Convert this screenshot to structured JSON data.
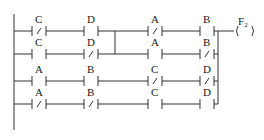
{
  "diagram": {
    "type": "ladder-logic",
    "output": {
      "label": "F",
      "subscript": "2"
    },
    "rungs": [
      {
        "contacts": [
          {
            "label": "C",
            "negated": true
          },
          {
            "label": "D",
            "negated": false
          },
          {
            "label": "A",
            "negated": true
          },
          {
            "label": "B",
            "negated": false
          }
        ]
      },
      {
        "contacts": [
          {
            "label": "C",
            "negated": false
          },
          {
            "label": "D",
            "negated": true
          },
          {
            "label": "A",
            "negated": false
          },
          {
            "label": "B",
            "negated": true
          }
        ]
      },
      {
        "contacts": [
          {
            "label": "A",
            "negated": false
          },
          {
            "label": "B",
            "negated": false
          },
          {
            "label": "C",
            "negated": true
          },
          {
            "label": "D",
            "negated": true
          }
        ]
      },
      {
        "contacts": [
          {
            "label": "A",
            "negated": true
          },
          {
            "label": "B",
            "negated": true
          },
          {
            "label": "C",
            "negated": false
          },
          {
            "label": "D",
            "negated": false
          }
        ]
      }
    ]
  }
}
